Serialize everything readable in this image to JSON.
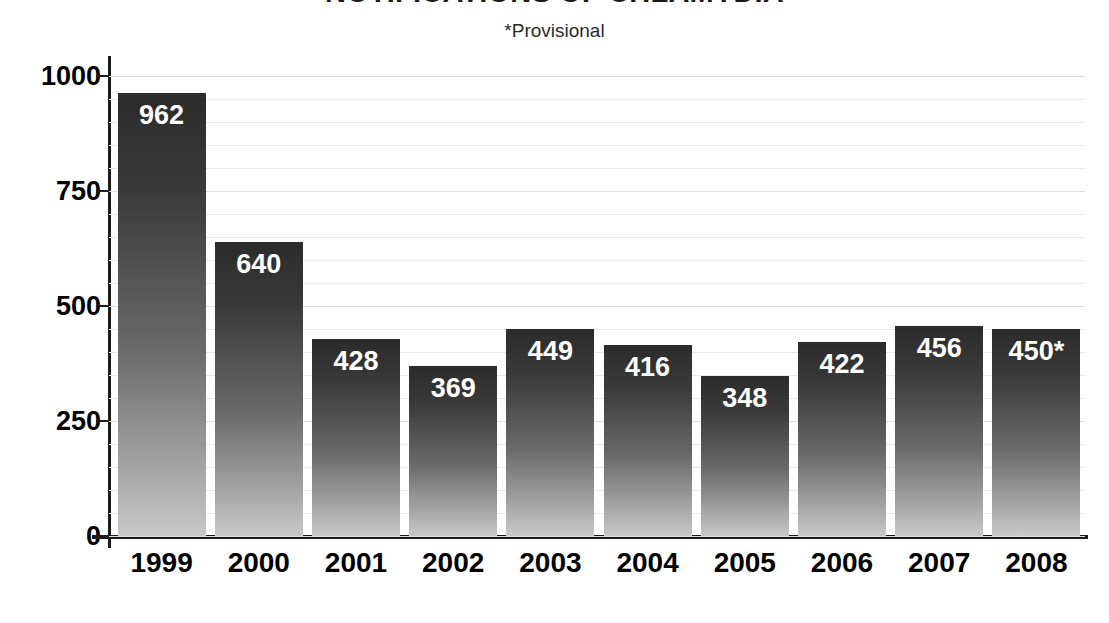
{
  "chart_data": {
    "type": "bar",
    "title": "NOTIFICATIONS OF CHLAMYDIA",
    "subtitle": "*Provisional",
    "xlabel": "",
    "ylabel": "",
    "categories": [
      "1999",
      "2000",
      "2001",
      "2002",
      "2003",
      "2004",
      "2005",
      "2006",
      "2007",
      "2008"
    ],
    "values": [
      962,
      640,
      428,
      369,
      449,
      416,
      348,
      422,
      456,
      450
    ],
    "value_labels": [
      "962",
      "640",
      "428",
      "369",
      "449",
      "416",
      "348",
      "422",
      "456",
      "450*"
    ],
    "ylim": [
      0,
      1000
    ],
    "y_ticks": [
      0,
      250,
      500,
      750,
      1000
    ],
    "y_tick_labels": [
      "0",
      "250",
      "500",
      "750",
      "1000"
    ],
    "minor_gridline_step": 50,
    "grid": true,
    "legend": "none",
    "annotations": [
      "*Provisional"
    ],
    "colors": {
      "bar_top": "#2b2b2b",
      "bar_bottom": "#c9c9c9",
      "axis": "#1c1c1c",
      "gridline": "#e9e9e9",
      "value_label": "#ffffff",
      "background": "#ffffff"
    }
  }
}
